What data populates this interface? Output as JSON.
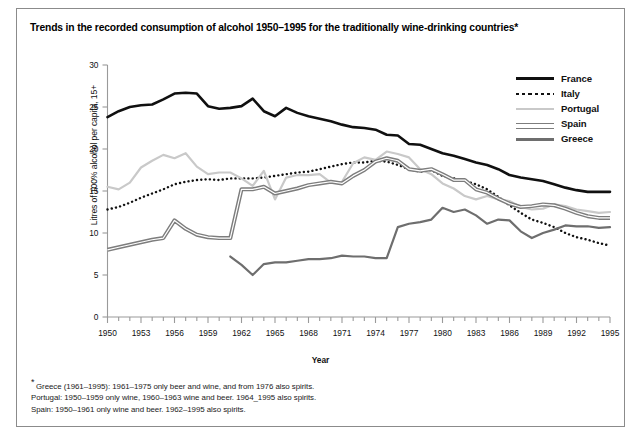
{
  "title": "Trends in the recorded consumption of alcohol 1950–1995 for the traditionally wine-drinking countries*",
  "axes": {
    "ylabel": "Litres of 100% alcohol per capita, 15+",
    "xlabel": "Year"
  },
  "legend": {
    "items": [
      {
        "label": "France",
        "style": "thick-solid-black",
        "color": "#101010"
      },
      {
        "label": "Italy",
        "style": "dotted-black",
        "color": "#111111"
      },
      {
        "label": "Portugal",
        "style": "solid-light-gray",
        "color": "#c9c9c9"
      },
      {
        "label": "Spain",
        "style": "double-line-gray",
        "color": "#7d7d7d"
      },
      {
        "label": "Greece",
        "style": "solid-dark-gray",
        "color": "#6e6e6e"
      }
    ]
  },
  "footnotes": [
    "Greece (1961–1995): 1961–1975 only beer and wine, and from 1976 also spirits.",
    "Portugal: 1950–1959 only wine, 1960–1963 wine and beer. 1964_1995 also spirits.",
    "Spain: 1950–1961 only wine and beer. 1962–1995 also spirits."
  ],
  "footnote_marker": "*",
  "chart_data": {
    "type": "line",
    "title": "Trends in the recorded consumption of alcohol 1950–1995 for the traditionally wine-drinking countries*",
    "xlabel": "Year",
    "ylabel": "Litres of 100% alcohol per capita, 15+",
    "xlim": [
      1950,
      1995
    ],
    "ylim": [
      0,
      30
    ],
    "yticks": [
      0,
      5,
      10,
      15,
      20,
      25,
      30
    ],
    "xticks": [
      1950,
      1953,
      1956,
      1959,
      1962,
      1965,
      1968,
      1971,
      1974,
      1977,
      1980,
      1983,
      1986,
      1989,
      1992,
      1995
    ],
    "xtick_minor_step": 1,
    "grid": false,
    "legend_position": "top-right",
    "x": [
      1950,
      1951,
      1952,
      1953,
      1954,
      1955,
      1956,
      1957,
      1958,
      1959,
      1960,
      1961,
      1962,
      1963,
      1964,
      1965,
      1966,
      1967,
      1968,
      1969,
      1970,
      1971,
      1972,
      1973,
      1974,
      1975,
      1976,
      1977,
      1978,
      1979,
      1980,
      1981,
      1982,
      1983,
      1984,
      1985,
      1986,
      1987,
      1988,
      1989,
      1990,
      1991,
      1992,
      1993,
      1994,
      1995
    ],
    "series": [
      {
        "name": "France",
        "color": "#101010",
        "style": "solid",
        "width": 2.6,
        "values": [
          23.8,
          24.5,
          25.0,
          25.2,
          25.3,
          25.9,
          26.6,
          26.7,
          26.6,
          25.1,
          24.8,
          24.9,
          25.1,
          26.0,
          24.5,
          23.9,
          24.9,
          24.3,
          23.9,
          23.6,
          23.3,
          22.9,
          22.6,
          22.5,
          22.3,
          21.7,
          21.6,
          20.6,
          20.5,
          20.0,
          19.5,
          19.2,
          18.8,
          18.4,
          18.1,
          17.6,
          16.9,
          16.6,
          16.4,
          16.2,
          15.8,
          15.4,
          15.1,
          14.9,
          14.9,
          14.9
        ]
      },
      {
        "name": "Italy",
        "color": "#111111",
        "style": "dotted",
        "width": 2.4,
        "values": [
          12.8,
          13.1,
          13.6,
          14.2,
          14.7,
          15.2,
          15.8,
          16.1,
          16.3,
          16.4,
          16.3,
          16.5,
          16.5,
          16.5,
          16.6,
          16.8,
          17.0,
          17.2,
          17.3,
          17.6,
          17.9,
          18.2,
          18.4,
          18.4,
          18.6,
          18.5,
          18.1,
          17.6,
          17.3,
          17.5,
          16.8,
          16.5,
          16.2,
          15.8,
          15.2,
          14.3,
          13.3,
          12.4,
          11.6,
          11.2,
          10.7,
          10.0,
          9.5,
          9.2,
          8.8,
          8.5
        ]
      },
      {
        "name": "Portugal",
        "color": "#c9c9c9",
        "style": "solid",
        "width": 2.2,
        "values": [
          15.5,
          15.2,
          16.0,
          17.8,
          18.6,
          19.3,
          18.9,
          19.5,
          17.9,
          17.0,
          17.2,
          17.2,
          16.5,
          15.6,
          17.4,
          14.0,
          16.6,
          16.9,
          16.9,
          17.0,
          16.0,
          16.1,
          18.3,
          19.0,
          18.7,
          19.7,
          19.4,
          19.0,
          17.6,
          17.0,
          15.9,
          15.3,
          14.4,
          14.0,
          14.4,
          14.0,
          13.8,
          13.1,
          12.8,
          12.9,
          13.4,
          13.2,
          12.8,
          12.6,
          12.4,
          12.5
        ]
      },
      {
        "name": "Spain",
        "color": "#7d7d7d",
        "style": "double",
        "width": 2.4,
        "values": [
          8.0,
          8.3,
          8.6,
          8.9,
          9.2,
          9.4,
          11.5,
          10.5,
          9.8,
          9.5,
          9.4,
          9.4,
          15.2,
          15.2,
          15.5,
          14.7,
          15.0,
          15.3,
          15.7,
          15.9,
          16.1,
          15.9,
          16.8,
          17.5,
          18.5,
          18.9,
          18.6,
          17.6,
          17.4,
          17.6,
          17.0,
          16.3,
          16.3,
          15.2,
          14.8,
          14.1,
          13.5,
          13.1,
          13.2,
          13.4,
          13.3,
          12.9,
          12.4,
          12.0,
          11.8,
          11.8
        ]
      },
      {
        "name": "Greece",
        "color": "#6e6e6e",
        "style": "solid",
        "width": 2.2,
        "values": [
          null,
          null,
          null,
          null,
          null,
          null,
          null,
          null,
          null,
          null,
          null,
          7.2,
          6.2,
          5.0,
          6.3,
          6.5,
          6.5,
          6.7,
          6.9,
          6.9,
          7.0,
          7.3,
          7.2,
          7.2,
          7.0,
          7.0,
          10.7,
          11.1,
          11.3,
          11.6,
          13.0,
          12.5,
          12.8,
          12.1,
          11.1,
          11.6,
          11.5,
          10.2,
          9.4,
          10.0,
          10.4,
          10.9,
          10.8,
          10.8,
          10.6,
          10.7
        ]
      }
    ]
  }
}
